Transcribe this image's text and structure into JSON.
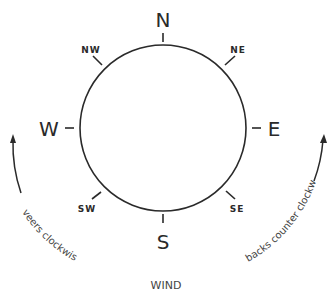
{
  "diagram": {
    "title": "WIND",
    "directions": {
      "n": "N",
      "ne": "NE",
      "e": "E",
      "se": "SE",
      "s": "S",
      "sw": "SW",
      "w": "W",
      "nw": "NW"
    },
    "left_arrow_label": "veers clockwise",
    "right_arrow_label": "backs counter clockwise",
    "stroke_color": "#2a2a2a"
  }
}
